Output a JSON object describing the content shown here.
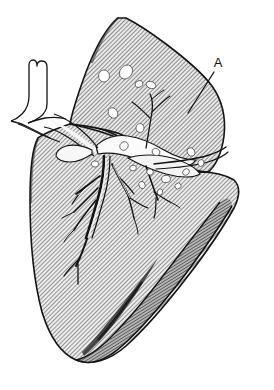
{
  "figure": {
    "kind": "anatomical-line-drawing",
    "view": "lateral",
    "background_color": "#ffffff",
    "ink_color": "#1a1a1a",
    "hatch_color": "#4a4a4a",
    "parenchyma_fill": "#b8b8b8",
    "lesion_fill": "#ffffff",
    "diaphragm_shadow_color": "#2e2e2e",
    "width": 274,
    "height": 390
  },
  "labels": [
    {
      "id": "label-a",
      "text": "A",
      "x": 218,
      "y": 67,
      "leader": {
        "from_x": 214,
        "from_y": 72,
        "to_x": 188,
        "to_y": 113
      }
    }
  ],
  "structures": {
    "upper_lobe": "upper lobe",
    "lower_lobe": "lower lobe",
    "oblique_fissure": "oblique fissure",
    "hilum": "hilum",
    "bronchial_tree": "bronchial tree",
    "trachea": "trachea",
    "pulmonary_vessel": "pulmonary vessel",
    "diaphragmatic_surface": "diaphragmatic surface",
    "nodules": "nodular lesions"
  },
  "nodules": [
    {
      "cx": 104,
      "cy": 76,
      "rx": 6,
      "ry": 5.5
    },
    {
      "cx": 126,
      "cy": 72,
      "rx": 7.5,
      "ry": 6
    },
    {
      "cx": 139,
      "cy": 84,
      "rx": 4,
      "ry": 3.2
    },
    {
      "cx": 151,
      "cy": 85,
      "rx": 5,
      "ry": 3.4
    },
    {
      "cx": 113,
      "cy": 113,
      "rx": 5.5,
      "ry": 4.5
    },
    {
      "cx": 140,
      "cy": 128,
      "rx": 4.5,
      "ry": 4
    },
    {
      "cx": 124,
      "cy": 146,
      "rx": 4.5,
      "ry": 4
    },
    {
      "cx": 95,
      "cy": 164,
      "rx": 3.6,
      "ry": 3
    },
    {
      "cx": 156,
      "cy": 152,
      "rx": 4,
      "ry": 3.4
    },
    {
      "cx": 191,
      "cy": 152,
      "rx": 4.4,
      "ry": 3.6
    },
    {
      "cx": 201,
      "cy": 163,
      "rx": 3.4,
      "ry": 3
    },
    {
      "cx": 186,
      "cy": 172,
      "rx": 3.6,
      "ry": 3
    },
    {
      "cx": 166,
      "cy": 179,
      "rx": 4.4,
      "ry": 3.6
    },
    {
      "cx": 150,
      "cy": 172,
      "rx": 3.4,
      "ry": 3
    },
    {
      "cx": 142,
      "cy": 185,
      "rx": 3.6,
      "ry": 3
    },
    {
      "cx": 160,
      "cy": 192,
      "rx": 3.2,
      "ry": 2.6
    },
    {
      "cx": 178,
      "cy": 186,
      "rx": 3.2,
      "ry": 2.8
    },
    {
      "cx": 133,
      "cy": 168,
      "rx": 3.4,
      "ry": 2.8
    }
  ]
}
